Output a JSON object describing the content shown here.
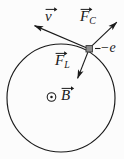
{
  "figure": {
    "width": 124,
    "height": 159,
    "background_color": "#fcfcfc",
    "stroke_color": "#1a1a1a"
  },
  "orbit": {
    "name": "circular-orbit-path",
    "center_x": 61,
    "center_y": 98,
    "radius": 54,
    "stroke_color": "#1a1a1a",
    "stroke_width": 1.1
  },
  "particle": {
    "name": "electron-charge-marker",
    "x": 89,
    "y": 49,
    "shape": "square",
    "size": 6,
    "fill_color": "#8a8a8a",
    "stroke_color": "#303030",
    "charge_label": "−e"
  },
  "vectors": [
    {
      "id": "velocity",
      "symbol": "v",
      "subscript": "",
      "label_text": "v",
      "description": "velocity vector, tangent to orbit, pointing up-left",
      "from_x": 89,
      "from_y": 49,
      "to_x": 33,
      "to_y": 25,
      "stroke_color": "#1a1a1a"
    },
    {
      "id": "centrifugal-force",
      "symbol": "F",
      "subscript": "C",
      "label_text": "F",
      "description": "centrifugal force vector, radially outward, pointing up-right",
      "from_x": 89,
      "from_y": 49,
      "to_x": 118,
      "to_y": 21,
      "stroke_color": "#1a1a1a"
    },
    {
      "id": "lorentz-force",
      "symbol": "F",
      "subscript": "L",
      "label_text": "F",
      "description": "Lorentz force vector, radially inward, pointing down-left",
      "from_x": 89,
      "from_y": 49,
      "to_x": 77,
      "to_y": 80,
      "stroke_color": "#1a1a1a"
    }
  ],
  "labels": {
    "velocity": "v",
    "force_c_symbol": "F",
    "force_c_subscript": "C",
    "force_l_symbol": "F",
    "force_l_subscript": "L",
    "charge": "−e",
    "bfield_symbol": "B",
    "bfield_direction_icon": "⊙"
  },
  "bfield": {
    "name": "magnetic-field-out-of-page",
    "icon": "⊙",
    "icon_meaning": "field points out of the page",
    "icon_x": 51,
    "icon_y": 97,
    "label_x": 64,
    "label_y": 97,
    "symbol": "B"
  }
}
